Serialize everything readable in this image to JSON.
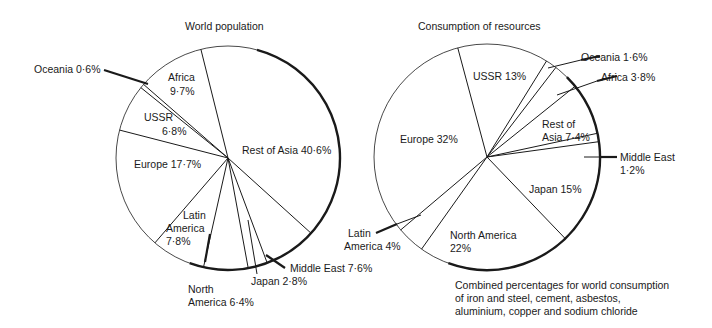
{
  "chart_data": [
    {
      "type": "pie",
      "title": "World population",
      "start_angle_deg": -14,
      "direction": "clockwise",
      "slices": [
        {
          "label": "Rest of Asia",
          "value": 40.6,
          "display": "Rest of Asia 40·6%"
        },
        {
          "label": "Middle East",
          "value": 7.6,
          "display": "Middle East 7·6%"
        },
        {
          "label": "Japan",
          "value": 2.8,
          "display": "Japan 2·8%"
        },
        {
          "label": "North America",
          "value": 6.4,
          "display": "North America 6·4%"
        },
        {
          "label": "Latin America",
          "value": 7.8,
          "display": "Latin America 7·8%"
        },
        {
          "label": "Europe",
          "value": 17.7,
          "display": "Europe 17·7%"
        },
        {
          "label": "USSR",
          "value": 6.8,
          "display": "USSR 6·8%"
        },
        {
          "label": "Oceania",
          "value": 0.6,
          "display": "Oceania 0·6%"
        },
        {
          "label": "Africa",
          "value": 9.7,
          "display": "Africa 9·7%"
        }
      ],
      "units": "%"
    },
    {
      "type": "pie",
      "title": "Consumption of resources",
      "subtitle": "Combined percentages for world consumption of iron and steel, cement, asbestos, aluminium, copper and sodium chloride",
      "start_angle_deg": -15,
      "direction": "clockwise",
      "slices": [
        {
          "label": "USSR",
          "value": 13,
          "display": "USSR 13%"
        },
        {
          "label": "Oceania",
          "value": 1.6,
          "display": "Oceania 1·6%"
        },
        {
          "label": "Africa",
          "value": 3.8,
          "display": "Africa 3·8%"
        },
        {
          "label": "Rest of Asia",
          "value": 7.4,
          "display": "Rest of Asia 7·4%"
        },
        {
          "label": "Middle East",
          "value": 1.2,
          "display": "Middle East 1·2%"
        },
        {
          "label": "Japan",
          "value": 15,
          "display": "Japan 15%"
        },
        {
          "label": "North America",
          "value": 22,
          "display": "North America 22%"
        },
        {
          "label": "Latin America",
          "value": 4,
          "display": "Latin America 4%"
        },
        {
          "label": "Europe",
          "value": 32,
          "display": "Europe 32%"
        }
      ],
      "units": "%"
    }
  ],
  "left": {
    "title": "World population",
    "labels": {
      "oceania": "Oceania 0·6%",
      "africa_1": "Africa",
      "africa_2": "9·7%",
      "ussr_1": "USSR",
      "ussr_2": "6·8%",
      "europe": "Europe 17·7%",
      "rest_of_asia": "Rest of Asia 40·6%",
      "latin_1": "Latin",
      "latin_2": "America",
      "latin_3": "7·8%",
      "north_1": "North",
      "north_2": "America 6·4%",
      "japan": "Japan 2·8%",
      "middle_east": "Middle East 7·6%"
    }
  },
  "right": {
    "title": "Consumption of resources",
    "labels": {
      "ussr": "USSR 13%",
      "oceania": "Oceania 1·6%",
      "africa": "Africa 3·8%",
      "rest_1": "Rest of",
      "rest_2": "Asia 7·4%",
      "europe": "Europe 32%",
      "middle_1": "Middle East",
      "middle_2": "1·2%",
      "japan": "Japan 15%",
      "north_1": "North America",
      "north_2": "22%",
      "latin_1": "Latin",
      "latin_2": "America 4%"
    },
    "caption": [
      "Combined percentages for world consumption",
      "of iron and steel, cement, asbestos,",
      "aluminium, copper and sodium chloride"
    ]
  },
  "colors": {
    "ink": "#1a1a1a",
    "background": "#ffffff"
  }
}
